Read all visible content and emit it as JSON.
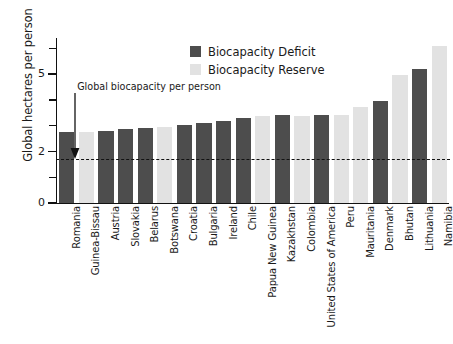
{
  "chart_data": {
    "type": "bar",
    "title": "",
    "xlabel": "",
    "ylabel": "Global hectares per person",
    "ylim": [
      0,
      6.4
    ],
    "yticks": [
      0,
      1,
      2,
      3,
      4,
      5,
      6
    ],
    "ytick_labels": {
      "0": "0",
      "2": "2",
      "5": "5"
    },
    "grid": false,
    "legend_position": "top-center",
    "categories": [
      "Romania",
      "Guinea-Bissau",
      "Austria",
      "Slovakia",
      "Belarus",
      "Botswana",
      "Croatia",
      "Bulgaria",
      "Ireland",
      "Chile",
      "Papua New Guinea",
      "Kazakhstan",
      "Colombia",
      "United States of America",
      "Peru",
      "Mauritania",
      "Denmark",
      "Bhutan",
      "Lithuania",
      "Namibia"
    ],
    "values": [
      2.76,
      2.76,
      2.8,
      2.88,
      2.92,
      2.94,
      3.02,
      3.12,
      3.2,
      3.28,
      3.38,
      3.4,
      3.38,
      3.4,
      3.42,
      3.72,
      3.96,
      4.98,
      5.2,
      6.08
    ],
    "series_of": [
      "Biocapacity Deficit",
      "Biocapacity Reserve",
      "Biocapacity Deficit",
      "Biocapacity Deficit",
      "Biocapacity Deficit",
      "Biocapacity Reserve",
      "Biocapacity Deficit",
      "Biocapacity Deficit",
      "Biocapacity Deficit",
      "Biocapacity Deficit",
      "Biocapacity Reserve",
      "Biocapacity Deficit",
      "Biocapacity Reserve",
      "Biocapacity Deficit",
      "Biocapacity Reserve",
      "Biocapacity Reserve",
      "Biocapacity Deficit",
      "Biocapacity Reserve",
      "Biocapacity Deficit",
      "Biocapacity Reserve"
    ],
    "series": [
      {
        "name": "Biocapacity Deficit",
        "color": "#4d4d4d",
        "points": [
          {
            "category": "Romania",
            "value": 2.76
          },
          {
            "category": "Austria",
            "value": 2.8
          },
          {
            "category": "Slovakia",
            "value": 2.88
          },
          {
            "category": "Belarus",
            "value": 2.92
          },
          {
            "category": "Croatia",
            "value": 3.02
          },
          {
            "category": "Bulgaria",
            "value": 3.12
          },
          {
            "category": "Ireland",
            "value": 3.2
          },
          {
            "category": "Chile",
            "value": 3.28
          },
          {
            "category": "Kazakhstan",
            "value": 3.4
          },
          {
            "category": "United States of America",
            "value": 3.4
          },
          {
            "category": "Denmark",
            "value": 3.96
          },
          {
            "category": "Lithuania",
            "value": 5.2
          }
        ]
      },
      {
        "name": "Biocapacity Reserve",
        "color": "#e2e2e2",
        "points": [
          {
            "category": "Guinea-Bissau",
            "value": 2.76
          },
          {
            "category": "Botswana",
            "value": 2.94
          },
          {
            "category": "Papua New Guinea",
            "value": 3.38
          },
          {
            "category": "Colombia",
            "value": 3.38
          },
          {
            "category": "Peru",
            "value": 3.42
          },
          {
            "category": "Mauritania",
            "value": 3.72
          },
          {
            "category": "Bhutan",
            "value": 4.98
          },
          {
            "category": "Namibia",
            "value": 6.08
          }
        ]
      }
    ],
    "annotations": [
      {
        "text": "Global biocapacity per person",
        "value": 1.72,
        "type": "dashed-reference-line-with-arrow"
      }
    ],
    "reference_line": {
      "label": "Global biocapacity per person",
      "value": 1.72,
      "style": "dashed",
      "color": "#111111"
    }
  },
  "legend": {
    "items": [
      {
        "label": "Biocapacity Deficit",
        "color": "#4d4d4d",
        "key": "deficit"
      },
      {
        "label": "Biocapacity Reserve",
        "color": "#e2e2e2",
        "key": "reserve"
      }
    ]
  }
}
